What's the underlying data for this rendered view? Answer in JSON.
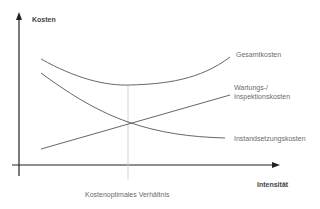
{
  "diagram": {
    "y_axis_label": "Kosten",
    "x_axis_label": "Intensität",
    "optimum_label": "Kostenoptimales Verhältnis",
    "curves": {
      "total": "Gesamtkosten",
      "maintenance_line1": "Wartungs-/",
      "maintenance_line2": "Inspektionskosten",
      "repair": "Instandsetzungskosten"
    },
    "colors": {
      "axis": "#222222",
      "curve": "#555555",
      "text": "#6b6b6b",
      "optimum_line": "#c8c8c8"
    }
  }
}
